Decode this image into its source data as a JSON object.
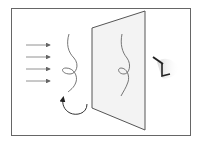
{
  "diagram": {
    "colors": {
      "background": "#ffffff",
      "frame": "#555555",
      "screen_fill": "#f2f2f2",
      "screen_edge": "#555555",
      "wire": "#666666",
      "arrow": "#666666",
      "eye": "#333333"
    },
    "elements": {
      "light_rays": {
        "count": 4,
        "icon": "right-arrow-icon"
      },
      "wire": {
        "icon": "twisted-wire-icon"
      },
      "rotation": {
        "icon": "rotate-counterclockwise-icon"
      },
      "screen": {
        "icon": "projection-screen-icon"
      },
      "shadow": {
        "icon": "wire-shadow-icon"
      },
      "observer": {
        "icon": "eye-icon"
      }
    }
  }
}
